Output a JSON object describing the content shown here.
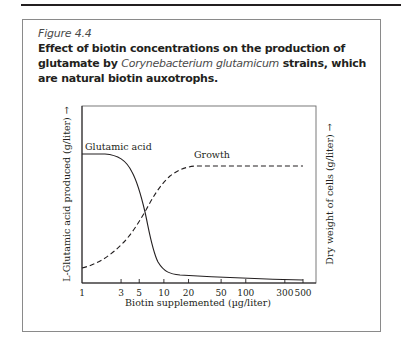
{
  "figure": {
    "label": "Figure 4.4",
    "title_part1": "Effect of biotin concentrations on the production of glutamate by ",
    "title_species": "Corynebacterium glutamicum",
    "title_part2": " strains, which are natural biotin auxotrophs."
  },
  "chart_data": {
    "type": "line",
    "title": "Effect of biotin concentrations on the production of glutamate by Corynebacterium glutamicum strains, which are natural biotin auxotrophs.",
    "xlabel": "Biotin supplemented (µg/liter)",
    "ylabel_left": "L-Glutamic acid produced (g/liter) →",
    "ylabel_right": "Dry weight of cells (g/liter) →",
    "x_scale": "log",
    "xlim": [
      1,
      500
    ],
    "x_ticks": [
      1,
      3,
      5,
      10,
      20,
      50,
      100,
      300,
      500
    ],
    "x_tick_labels": [
      "1",
      "3",
      "5",
      "10",
      "20",
      "50",
      "100",
      "300",
      "500"
    ],
    "y_units": "relative (no numeric ticks)",
    "grid": false,
    "legend": "inline labels",
    "series": [
      {
        "name": "Glutamic acid",
        "style": "solid",
        "axis": "left",
        "x": [
          1,
          1.5,
          2,
          2.5,
          3,
          4,
          5,
          6,
          7,
          8,
          10,
          12,
          15,
          20,
          50,
          100,
          300,
          500
        ],
        "values": [
          1.0,
          1.0,
          0.99,
          0.97,
          0.93,
          0.8,
          0.6,
          0.38,
          0.2,
          0.1,
          0.05,
          0.03,
          0.025,
          0.022,
          0.018,
          0.015,
          0.01,
          0.008
        ]
      },
      {
        "name": "Growth",
        "style": "dashed",
        "axis": "right",
        "x": [
          1,
          1.5,
          2,
          3,
          4,
          5,
          6,
          8,
          10,
          15,
          20,
          50,
          100,
          300,
          500
        ],
        "values": [
          0.12,
          0.18,
          0.25,
          0.36,
          0.46,
          0.55,
          0.64,
          0.76,
          0.83,
          0.88,
          0.89,
          0.89,
          0.89,
          0.89,
          0.89
        ]
      }
    ],
    "annotations": [
      "Glutamic acid",
      "Growth"
    ]
  }
}
